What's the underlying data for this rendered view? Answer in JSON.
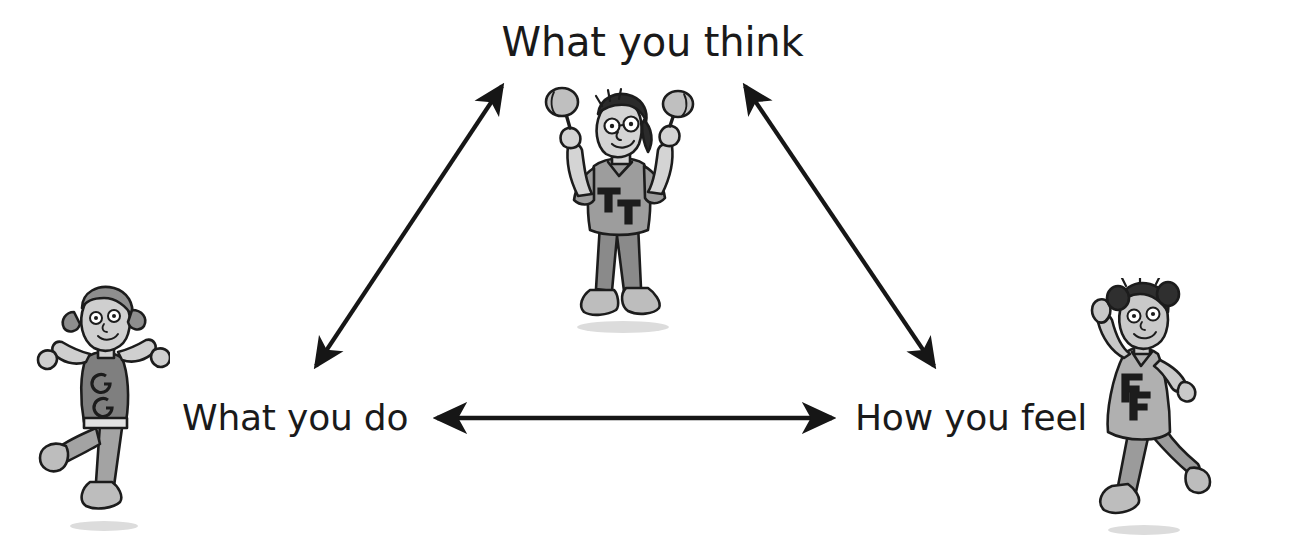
{
  "diagram": {
    "background_color": "#ffffff",
    "text_color": "#1a1a1a",
    "arrow_color": "#161616",
    "nodes": [
      {
        "id": "think",
        "label": "What you think",
        "position": "top-center"
      },
      {
        "id": "do",
        "label": "What you do",
        "position": "bottom-left"
      },
      {
        "id": "feel",
        "label": "How you feel",
        "position": "bottom-right"
      }
    ],
    "connections": [
      {
        "id": "do-think",
        "from": "What you do",
        "to": "What you think",
        "style": "double-headed-arrow",
        "orientation": "diagonal-left"
      },
      {
        "id": "think-feel",
        "from": "What you think",
        "to": "How you feel",
        "style": "double-headed-arrow",
        "orientation": "diagonal-right"
      },
      {
        "id": "do-feel",
        "from": "What you do",
        "to": "How you feel",
        "style": "double-headed-arrow",
        "orientation": "horizontal"
      }
    ],
    "illustrations": [
      {
        "id": "think",
        "description": "cartoon child standing and shaking maracas",
        "shirt_letters": "TT",
        "skin_color": "#d4d4d4",
        "shirt_color": "#9d9d9d",
        "pants_color": "#8a8a8a",
        "hair_color": "#2b2b2b",
        "outline_color": "#1c1c1c"
      },
      {
        "id": "do",
        "description": "cartoon child dancing with arms and leg raised",
        "shirt_letters": "GG",
        "skin_color": "#cfcfcf",
        "shirt_color": "#7f7f7f",
        "pants_color": "#a3a3a3",
        "hair_color": "#8e8e8e",
        "outline_color": "#1c1c1c"
      },
      {
        "id": "feel",
        "description": "cartoon child in a dress skipping with hand raised",
        "shirt_letters": "FF",
        "skin_color": "#c9c9c9",
        "shirt_color": "#b0b0b0",
        "pants_color": "#9b9b9b",
        "hair_color": "#2f2f2f",
        "outline_color": "#1c1c1c"
      }
    ]
  }
}
